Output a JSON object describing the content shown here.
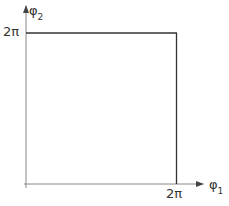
{
  "diagram": {
    "y_axis_label": "φ",
    "y_axis_subscript": "2",
    "x_axis_label": "φ",
    "x_axis_subscript": "1",
    "y_tick_label": "2π",
    "x_tick_label": "2π",
    "colors": {
      "axis": "#555555",
      "square": "#333333",
      "text": "#333333"
    }
  }
}
